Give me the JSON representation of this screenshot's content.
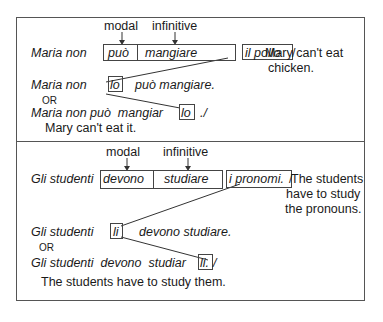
{
  "example1": {
    "label_modal": "modal",
    "label_infinitive": "infinitive",
    "line1": {
      "subject": "Maria non",
      "modal": "può",
      "infinitive": "mangiare",
      "object": "il pollo",
      "end": "/"
    },
    "translation1_a": "Mary can't eat",
    "translation1_b": "chicken.",
    "line2": {
      "subject": "Maria non",
      "pronoun": "lo",
      "rest": "può mangiare."
    },
    "or": "OR",
    "line3": {
      "prefix": "Maria non può  mangiar",
      "pronoun": "lo",
      "end": "./"
    },
    "translation2": "Mary can't eat it."
  },
  "example2": {
    "label_modal": "modal",
    "label_infinitive": "infinitive",
    "line1": {
      "subject": "Gli studenti",
      "modal": "devono",
      "infinitive": "studiare",
      "object": "i pronomi.",
      "end": "/"
    },
    "translation1_a": "The students",
    "translation1_b": "have to study",
    "translation1_c": "the pronouns.",
    "line2": {
      "subject": "Gli studenti",
      "pronoun": "li",
      "rest": "devono studiare."
    },
    "or": "OR",
    "line3": {
      "prefix": "Gli studenti  devono  studiar",
      "pronoun": "li.",
      "end": "/"
    },
    "translation2": "The students have to study them."
  }
}
